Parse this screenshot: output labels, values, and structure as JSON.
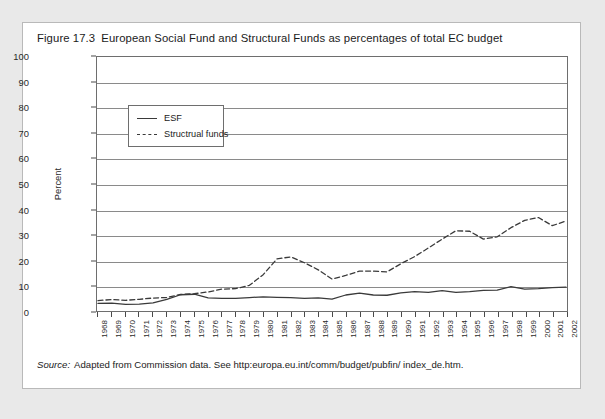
{
  "figure": {
    "number": "Figure 17.3",
    "title": "European Social Fund and Structural Funds as percentages of total EC budget",
    "source_label": "Source:",
    "source_text": "Adapted from Commission data. See http:europa.eu.int/comm/budget/pubfin/ index_de.htm."
  },
  "chart_data": {
    "type": "line",
    "title": "European Social Fund and Structural Funds as percentages of total EC budget",
    "xlabel": "",
    "ylabel": "Percent",
    "ylim": [
      0,
      100
    ],
    "yticks": [
      0,
      10,
      20,
      30,
      40,
      50,
      60,
      70,
      80,
      90,
      100
    ],
    "grid": true,
    "legend_position": "top-left-inside",
    "categories": [
      "1968",
      "1969",
      "1970",
      "1971",
      "1972",
      "1973",
      "1974",
      "1975",
      "1976",
      "1977",
      "1978",
      "1979",
      "1980",
      "1981",
      "1982",
      "1983",
      "1984",
      "1985",
      "1986",
      "1987",
      "1988",
      "1989",
      "1990",
      "1991",
      "1992",
      "1993",
      "1994",
      "1995",
      "1996",
      "1997",
      "1998",
      "1999",
      "2000",
      "2001",
      "2002"
    ],
    "series": [
      {
        "name": "ESF",
        "style": "solid",
        "color": "#3a3a3a",
        "values": [
          3.0,
          3.1,
          2.6,
          2.7,
          3.2,
          4.6,
          6.4,
          6.6,
          5.2,
          5.0,
          5.0,
          5.3,
          5.6,
          5.4,
          5.3,
          5.0,
          5.2,
          4.7,
          6.3,
          7.0,
          6.3,
          6.2,
          7.1,
          7.6,
          7.3,
          8.0,
          7.3,
          7.6,
          8.1,
          8.2,
          9.6,
          8.6,
          8.8,
          9.2,
          9.4
        ]
      },
      {
        "name": "Structrual funds",
        "style": "dashed",
        "color": "#3a3a3a",
        "values": [
          4.1,
          4.5,
          4.2,
          4.6,
          5.1,
          5.3,
          6.5,
          6.8,
          7.5,
          8.6,
          8.8,
          10.1,
          14.3,
          20.5,
          21.3,
          19.0,
          16.2,
          12.6,
          14.0,
          15.7,
          15.7,
          15.4,
          18.6,
          21.4,
          24.8,
          28.3,
          31.6,
          31.4,
          28.3,
          29.2,
          32.8,
          35.7,
          36.8,
          33.6,
          35.4
        ]
      }
    ]
  },
  "axis": {
    "y_tick_labels": [
      "0",
      "10",
      "20",
      "30",
      "40",
      "50",
      "60",
      "70",
      "80",
      "90",
      "100"
    ],
    "y_axis_title": "Percent"
  },
  "legend": {
    "items": [
      {
        "label": "ESF",
        "style": "solid"
      },
      {
        "label": "Structrual funds",
        "style": "dashed"
      }
    ]
  }
}
